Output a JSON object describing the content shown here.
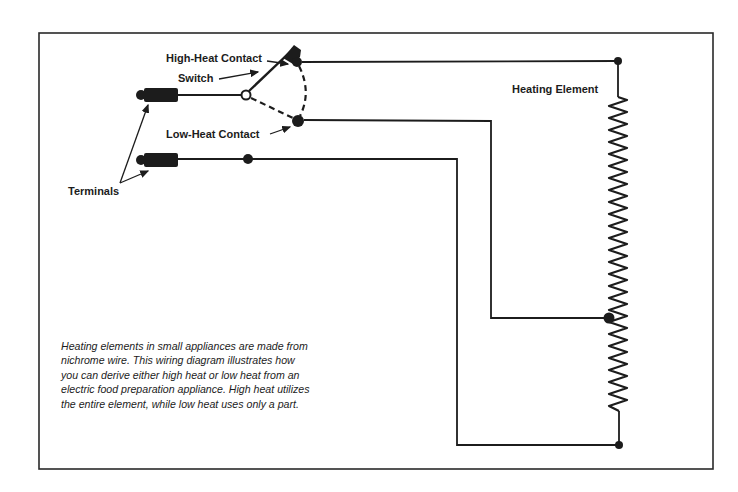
{
  "figure": {
    "labels": {
      "high_heat_contact": "High-Heat Contact",
      "switch": "Switch",
      "low_heat_contact": "Low-Heat Contact",
      "terminals": "Terminals",
      "heating_element": "Heating Element"
    },
    "caption": {
      "lines": [
        "Heating elements in small appliances are made from",
        "nichrome wire.  This wiring diagram illustrates how",
        "you can derive either high heat or low heat from an",
        "electric food preparation appliance.  High heat utilizes",
        "the entire element, while low heat uses only a part."
      ]
    },
    "colors": {
      "ink": "#1c1c1c",
      "background": "#ffffff",
      "frame": "#2a2a2a"
    }
  }
}
